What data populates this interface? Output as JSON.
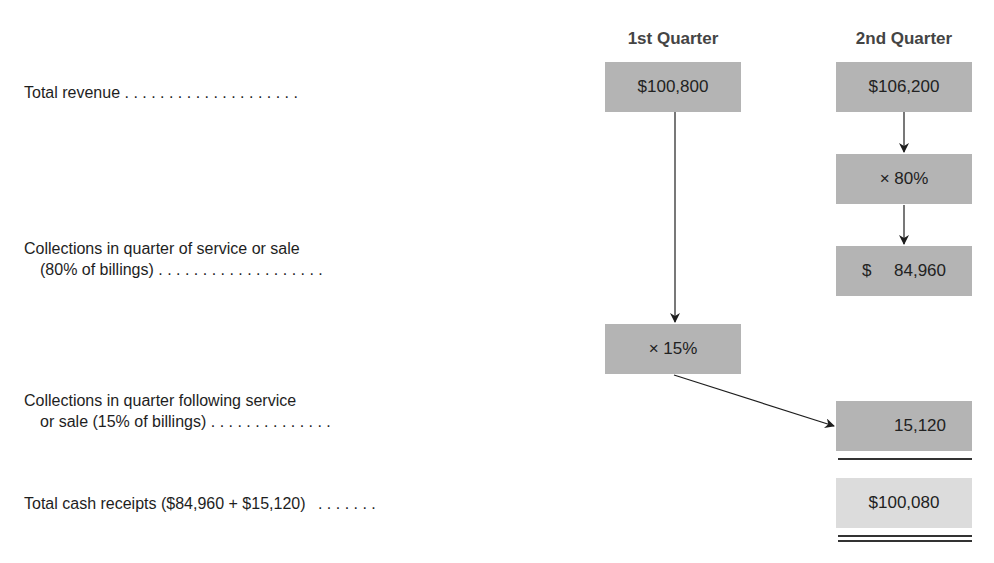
{
  "headers": {
    "q1": "1st Quarter",
    "q2": "2nd Quarter"
  },
  "rows": [
    {
      "label_line1": "Total revenue",
      "label_line2": "",
      "dots": ". . . . . . . . . . . . . . . . . . . ."
    },
    {
      "label_line1": "Collections in quarter of service or sale",
      "label_line2": "(80% of billings)",
      "dots": ". . . . . . . . . . . . . . . . . . ."
    },
    {
      "label_line1": "Collections in quarter following service",
      "label_line2": "or sale (15% of billings)",
      "dots": ". . . . . . . . . . . . . ."
    },
    {
      "label_line1": "Total cash receipts ($84,960 + $15,120)",
      "label_line2": "",
      "dots": ". . . . . . ."
    }
  ],
  "boxes": {
    "q1_revenue": "$100,800",
    "q2_revenue": "$106,200",
    "q2_multiplier": "× 80%",
    "q2_collections_symbol": "$",
    "q2_collections_value": "84,960",
    "q1_multiplier": "× 15%",
    "q2_following": "15,120",
    "q2_total": "$100,080"
  },
  "colors": {
    "box_fill": "#b4b4b4",
    "total_box_fill": "#dcdcdc",
    "header_text": "#444444",
    "arrow": "#1e1e1e"
  }
}
